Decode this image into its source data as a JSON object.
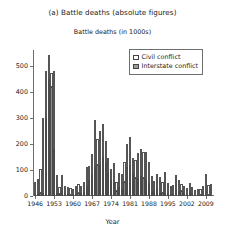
{
  "chart_data": {
    "type": "bar",
    "title": "(a) Battle deaths (absolute figures)",
    "subtitle": "Battle deaths (in 1000s)",
    "xlabel": "Year",
    "ylabel": "",
    "stacked": true,
    "grid": false,
    "legend_position": "top-right",
    "ylim": [
      0,
      560
    ],
    "yticks": [
      0,
      100,
      200,
      300,
      400,
      500
    ],
    "ytick_labels": [
      "0",
      "100",
      "200",
      "300",
      "400",
      "500"
    ],
    "xticks": [
      1946,
      1953,
      1960,
      1967,
      1974,
      1981,
      1988,
      1995,
      2002,
      2009
    ],
    "xtick_labels": [
      "1946",
      "1953",
      "1960",
      "1967",
      "1974",
      "1981",
      "1988",
      "1995",
      "2002",
      "2009"
    ],
    "xlim": [
      1945.2,
      2012.0
    ],
    "categories": [
      1946,
      1947,
      1948,
      1949,
      1950,
      1951,
      1952,
      1953,
      1954,
      1955,
      1956,
      1957,
      1958,
      1959,
      1960,
      1961,
      1962,
      1963,
      1964,
      1965,
      1966,
      1967,
      1968,
      1969,
      1970,
      1971,
      1972,
      1973,
      1974,
      1975,
      1976,
      1977,
      1978,
      1979,
      1980,
      1981,
      1982,
      1983,
      1984,
      1985,
      1986,
      1987,
      1988,
      1989,
      1990,
      1991,
      1992,
      1993,
      1994,
      1995,
      1996,
      1997,
      1998,
      1999,
      2000,
      2001,
      2002,
      2003,
      2004,
      2005,
      2006,
      2007,
      2008,
      2009,
      2010,
      2011
    ],
    "series": [
      {
        "name": "Interstate conflict",
        "color": "#8c8c8c",
        "values": [
          4,
          6,
          10,
          10,
          300,
          450,
          420,
          180,
          12,
          6,
          20,
          8,
          6,
          4,
          6,
          8,
          10,
          12,
          14,
          40,
          60,
          80,
          110,
          120,
          120,
          150,
          130,
          90,
          60,
          55,
          20,
          35,
          25,
          55,
          110,
          120,
          90,
          70,
          70,
          75,
          70,
          60,
          50,
          20,
          18,
          30,
          12,
          10,
          12,
          10,
          8,
          8,
          22,
          20,
          18,
          12,
          8,
          14,
          6,
          5,
          5,
          5,
          6,
          5,
          4,
          5
        ]
      },
      {
        "name": "Civil conflict",
        "color": "#ffffff",
        "values": [
          48,
          60,
          95,
          290,
          180,
          90,
          50,
          300,
          70,
          30,
          60,
          30,
          28,
          25,
          22,
          30,
          36,
          28,
          40,
          70,
          55,
          80,
          180,
          100,
          130,
          125,
          80,
          55,
          45,
          70,
          35,
          55,
          60,
          75,
          90,
          105,
          55,
          70,
          95,
          105,
          100,
          110,
          80,
          55,
          40,
          55,
          60,
          45,
          80,
          40,
          30,
          35,
          60,
          42,
          30,
          28,
          22,
          36,
          28,
          20,
          22,
          22,
          34,
          80,
          38,
          42
        ]
      }
    ]
  },
  "legend": {
    "items": [
      {
        "label": "Civil conflict",
        "swatch": "civil"
      },
      {
        "label": "Interstate conflict",
        "swatch": "interstate"
      }
    ]
  }
}
